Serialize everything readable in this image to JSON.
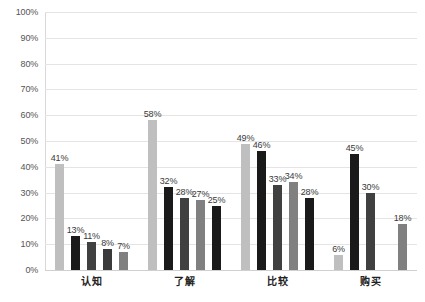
{
  "chart_data": {
    "type": "bar",
    "title": "",
    "subtitle": "",
    "xlabel": "",
    "ylabel": "",
    "ylim": [
      0,
      100
    ],
    "y_unit": "%",
    "grid": true,
    "legend": "none",
    "orientation": "vertical",
    "categories": [
      "认知",
      "了解",
      "比较",
      "购买"
    ],
    "y_ticks": [
      "0%",
      "10%",
      "20%",
      "30%",
      "40%",
      "50%",
      "60%",
      "70%",
      "80%",
      "90%",
      "100%"
    ],
    "y_tick_values": [
      0,
      10,
      20,
      30,
      40,
      50,
      60,
      70,
      80,
      90,
      100
    ],
    "series": [
      {
        "name": "series-1",
        "color": "#bfbfbf",
        "values": [
          41,
          58,
          49,
          6
        ],
        "labels": [
          "41%",
          "58%",
          "49%",
          "6%"
        ]
      },
      {
        "name": "series-2",
        "color": "#1a1a1a",
        "values": [
          13,
          32,
          46,
          45
        ],
        "labels": [
          "13%",
          "32%",
          "46%",
          "45%"
        ]
      },
      {
        "name": "series-3",
        "color": "#404040",
        "values": [
          11,
          28,
          33,
          30
        ],
        "labels": [
          "11%",
          "28%",
          "33%",
          "30%"
        ]
      },
      {
        "name": "series-4",
        "color": "#808080",
        "values": [
          8,
          27,
          34,
          null
        ],
        "labels": [
          "8%",
          "27%",
          "34%",
          ""
        ]
      },
      {
        "name": "series-5",
        "color": "#1a1a1a",
        "values": [
          7,
          25,
          28,
          18
        ],
        "labels": [
          "7%",
          "25%",
          "28%",
          "18%"
        ]
      }
    ],
    "groups": [
      {
        "category": "认知",
        "bars": [
          {
            "value": 41,
            "label": "41%",
            "color": "#bfbfbf"
          },
          {
            "value": 13,
            "label": "13%",
            "color": "#1a1a1a"
          },
          {
            "value": 11,
            "label": "11%",
            "color": "#404040"
          },
          {
            "value": 8,
            "label": "8%",
            "color": "#3a3a3a"
          },
          {
            "value": 7,
            "label": "7%",
            "color": "#808080"
          }
        ]
      },
      {
        "category": "了解",
        "bars": [
          {
            "value": 58,
            "label": "58%",
            "color": "#bfbfbf"
          },
          {
            "value": 32,
            "label": "32%",
            "color": "#1a1a1a"
          },
          {
            "value": 28,
            "label": "28%",
            "color": "#404040"
          },
          {
            "value": 27,
            "label": "27%",
            "color": "#808080"
          },
          {
            "value": 25,
            "label": "25%",
            "color": "#1a1a1a"
          }
        ]
      },
      {
        "category": "比较",
        "bars": [
          {
            "value": 49,
            "label": "49%",
            "color": "#bfbfbf"
          },
          {
            "value": 46,
            "label": "46%",
            "color": "#1a1a1a"
          },
          {
            "value": 33,
            "label": "33%",
            "color": "#404040"
          },
          {
            "value": 34,
            "label": "34%",
            "color": "#808080"
          },
          {
            "value": 28,
            "label": "28%",
            "color": "#1a1a1a"
          }
        ]
      },
      {
        "category": "购买",
        "bars": [
          {
            "value": 6,
            "label": "6%",
            "color": "#bfbfbf"
          },
          {
            "value": 45,
            "label": "45%",
            "color": "#1a1a1a"
          },
          {
            "value": 30,
            "label": "30%",
            "color": "#404040"
          },
          {
            "value": null,
            "label": "",
            "color": "transparent"
          },
          {
            "value": 18,
            "label": "18%",
            "color": "#808080"
          }
        ]
      }
    ]
  }
}
